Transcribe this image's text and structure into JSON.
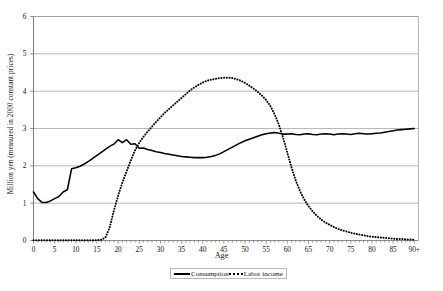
{
  "chart_data": {
    "type": "line",
    "title": "",
    "xlabel": "Age",
    "ylabel": "Million yen (measured in 2000 constant prices)",
    "xlim": [
      0,
      91
    ],
    "ylim": [
      0,
      6
    ],
    "ytick_labels": [
      "0",
      "1",
      "2",
      "3",
      "4",
      "5",
      "6"
    ],
    "ytick_values": [
      0,
      1,
      2,
      3,
      4,
      5,
      6
    ],
    "xtick_labels": [
      "0",
      "5",
      "10",
      "15",
      "20",
      "25",
      "30",
      "35",
      "40",
      "45",
      "50",
      "55",
      "60",
      "65",
      "70",
      "75",
      "80",
      "85",
      "90+"
    ],
    "xtick_values": [
      0,
      5,
      10,
      15,
      20,
      25,
      30,
      35,
      40,
      45,
      50,
      55,
      60,
      65,
      70,
      75,
      80,
      85,
      90
    ],
    "grid": "horizontal",
    "legend_position": "bottom",
    "x": [
      0,
      1,
      2,
      3,
      4,
      5,
      6,
      7,
      8,
      9,
      10,
      11,
      12,
      13,
      14,
      15,
      16,
      17,
      18,
      19,
      20,
      21,
      22,
      23,
      24,
      25,
      26,
      27,
      28,
      29,
      30,
      31,
      32,
      33,
      34,
      35,
      36,
      37,
      38,
      39,
      40,
      41,
      42,
      43,
      44,
      45,
      46,
      47,
      48,
      49,
      50,
      51,
      52,
      53,
      54,
      55,
      56,
      57,
      58,
      59,
      60,
      61,
      62,
      63,
      64,
      65,
      66,
      67,
      68,
      69,
      70,
      71,
      72,
      73,
      74,
      75,
      76,
      77,
      78,
      79,
      80,
      81,
      82,
      83,
      84,
      85,
      86,
      87,
      88,
      89,
      90
    ],
    "series": [
      {
        "name": "Consumption",
        "style": "solid",
        "color": "#000000",
        "values": [
          1.3,
          1.12,
          1.02,
          1.02,
          1.06,
          1.12,
          1.18,
          1.3,
          1.36,
          1.92,
          1.95,
          1.99,
          2.05,
          2.12,
          2.2,
          2.28,
          2.36,
          2.44,
          2.52,
          2.58,
          2.7,
          2.62,
          2.7,
          2.58,
          2.59,
          2.47,
          2.48,
          2.44,
          2.41,
          2.38,
          2.36,
          2.33,
          2.31,
          2.29,
          2.27,
          2.25,
          2.24,
          2.23,
          2.22,
          2.22,
          2.22,
          2.23,
          2.25,
          2.28,
          2.32,
          2.38,
          2.44,
          2.5,
          2.56,
          2.62,
          2.67,
          2.71,
          2.75,
          2.79,
          2.83,
          2.86,
          2.88,
          2.89,
          2.87,
          2.85,
          2.85,
          2.86,
          2.84,
          2.83,
          2.85,
          2.86,
          2.84,
          2.83,
          2.85,
          2.86,
          2.85,
          2.83,
          2.85,
          2.86,
          2.85,
          2.84,
          2.86,
          2.87,
          2.86,
          2.85,
          2.86,
          2.87,
          2.88,
          2.9,
          2.92,
          2.94,
          2.96,
          2.97,
          2.98,
          2.99,
          3.0
        ]
      },
      {
        "name": "Labor income",
        "style": "dotted",
        "color": "#000000",
        "values": [
          0.01,
          0.01,
          0.01,
          0.01,
          0.01,
          0.01,
          0.01,
          0.01,
          0.01,
          0.01,
          0.01,
          0.01,
          0.01,
          0.01,
          0.01,
          0.01,
          0.02,
          0.08,
          0.35,
          0.8,
          1.2,
          1.55,
          1.85,
          2.15,
          2.42,
          2.62,
          2.78,
          2.92,
          3.05,
          3.18,
          3.3,
          3.42,
          3.52,
          3.62,
          3.72,
          3.82,
          3.92,
          4.02,
          4.1,
          4.17,
          4.23,
          4.28,
          4.31,
          4.33,
          4.35,
          4.36,
          4.36,
          4.35,
          4.32,
          4.28,
          4.22,
          4.15,
          4.07,
          3.98,
          3.88,
          3.76,
          3.6,
          3.38,
          3.1,
          2.75,
          2.35,
          1.95,
          1.6,
          1.32,
          1.1,
          0.92,
          0.78,
          0.66,
          0.56,
          0.48,
          0.42,
          0.36,
          0.31,
          0.27,
          0.24,
          0.21,
          0.18,
          0.16,
          0.14,
          0.12,
          0.1,
          0.09,
          0.08,
          0.07,
          0.06,
          0.05,
          0.04,
          0.04,
          0.03,
          0.03,
          0.02
        ]
      }
    ]
  },
  "legend": {
    "items": [
      {
        "label": "Consumption",
        "style": "solid"
      },
      {
        "label": "Labor income",
        "style": "dotted"
      }
    ]
  }
}
